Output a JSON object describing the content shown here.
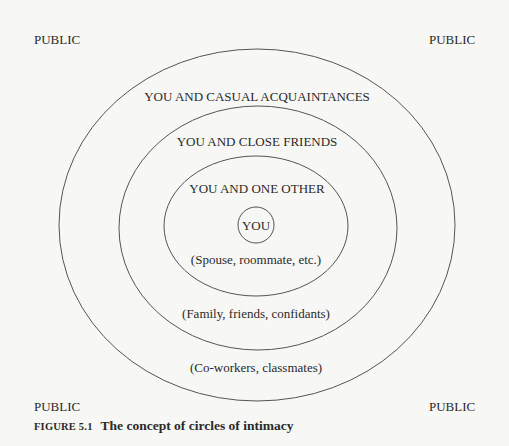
{
  "figure": {
    "number_label": "FIGURE 5.1",
    "title": "The concept of circles of intimacy"
  },
  "corners": {
    "top_left": "PUBLIC",
    "top_right": "PUBLIC",
    "bottom_left": "PUBLIC",
    "bottom_right": "PUBLIC"
  },
  "rings": [
    {
      "id": "casual-acquaintances",
      "title": "YOU AND CASUAL ACQUAINTANCES",
      "subtitle": "(Co-workers, classmates)"
    },
    {
      "id": "close-friends",
      "title": "YOU AND CLOSE FRIENDS",
      "subtitle": "(Family, friends, confidants)"
    },
    {
      "id": "one-other",
      "title": "YOU AND ONE OTHER",
      "subtitle": "(Spouse, roommate, etc.)"
    },
    {
      "id": "you",
      "title": "YOU"
    }
  ],
  "colors": {
    "line": "#555555",
    "text": "#2a2a2a",
    "background": "#f7f7f5"
  }
}
